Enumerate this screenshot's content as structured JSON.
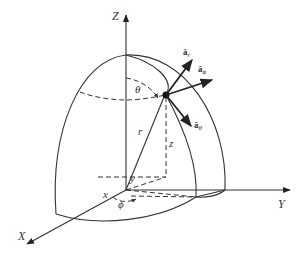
{
  "figure": {
    "axes": {
      "z_label": "Z",
      "y_label": "Y",
      "x_label": "X"
    },
    "variables": {
      "r": "r",
      "theta": "θ",
      "phi": "ϕ",
      "x": "x",
      "y": "y",
      "z": "z"
    },
    "unit_vectors": [
      {
        "name": "a_r",
        "base": "â",
        "sub": "r"
      },
      {
        "name": "a_phi",
        "base": "â",
        "sub": "ϕ"
      },
      {
        "name": "a_theta",
        "base": "â",
        "sub": "θ"
      }
    ],
    "colors": {
      "line": "#333333",
      "background": "#ffffff"
    }
  }
}
